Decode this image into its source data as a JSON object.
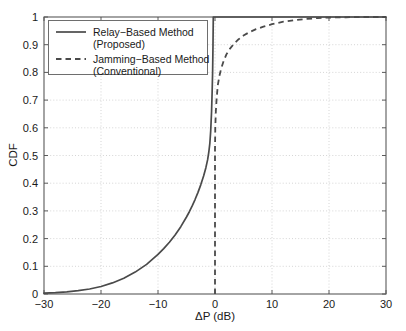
{
  "chart_data": {
    "type": "line",
    "title": "",
    "xlabel": "ΔP (dB)",
    "ylabel": "CDF",
    "xlim": [
      -30,
      30
    ],
    "ylim": [
      0,
      1
    ],
    "xticks": [
      -30,
      -20,
      -10,
      0,
      10,
      20,
      30
    ],
    "xticklabels": [
      "-30",
      "-20",
      "-10",
      "0",
      "10",
      "20",
      "30"
    ],
    "yticks": [
      0,
      0.1,
      0.2,
      0.3,
      0.4,
      0.5,
      0.6,
      0.7,
      0.8,
      0.9,
      1
    ],
    "yticklabels": [
      "0",
      "0.1",
      "0.2",
      "0.3",
      "0.4",
      "0.5",
      "0.6",
      "0.7",
      "0.8",
      "0.9",
      "1"
    ],
    "grid": true,
    "legend_position": "upper-left-inside",
    "line_color": "#4a4a4a",
    "grid_color": "#b9b9b9",
    "series": [
      {
        "name": "Relay−Based Method (Proposed)",
        "label_line1": "Relay−Based Method",
        "label_line2": "(Proposed)",
        "style": "solid",
        "x": [
          -30,
          -28,
          -26,
          -24,
          -22,
          -20,
          -18,
          -16,
          -14,
          -12,
          -10,
          -9,
          -8,
          -7,
          -6,
          -5,
          -4.5,
          -4,
          -3.5,
          -3,
          -2.5,
          -2,
          -1.6,
          -1.3,
          -1.1,
          -0.9,
          -0.75,
          -0.6,
          -0.5,
          -0.42,
          -0.35,
          -0.3,
          0,
          10,
          20,
          30
        ],
        "y": [
          0.003,
          0.005,
          0.008,
          0.012,
          0.018,
          0.027,
          0.04,
          0.057,
          0.079,
          0.107,
          0.143,
          0.164,
          0.187,
          0.213,
          0.243,
          0.278,
          0.297,
          0.318,
          0.341,
          0.366,
          0.394,
          0.426,
          0.456,
          0.484,
          0.51,
          0.545,
          0.59,
          0.66,
          0.73,
          0.8,
          0.9,
          1.0,
          1.0,
          1.0,
          1.0,
          1.0
        ]
      },
      {
        "name": "Jamming−Based Method (Conventional)",
        "label_line1": "Jamming−Based Method",
        "label_line2": "(Conventional)",
        "style": "dashed",
        "x": [
          0,
          0,
          0.05,
          0.15,
          0.3,
          0.5,
          0.8,
          1.1,
          1.5,
          2.0,
          2.6,
          3.3,
          4.1,
          5.0,
          6.0,
          7.2,
          8.5,
          10,
          12,
          14,
          16,
          18,
          20,
          23,
          26,
          30
        ],
        "y": [
          0.0,
          0.52,
          0.6,
          0.66,
          0.71,
          0.755,
          0.79,
          0.815,
          0.84,
          0.865,
          0.885,
          0.903,
          0.919,
          0.933,
          0.945,
          0.956,
          0.965,
          0.974,
          0.983,
          0.989,
          0.993,
          0.996,
          0.998,
          0.999,
          1.0,
          1.0
        ]
      }
    ]
  }
}
